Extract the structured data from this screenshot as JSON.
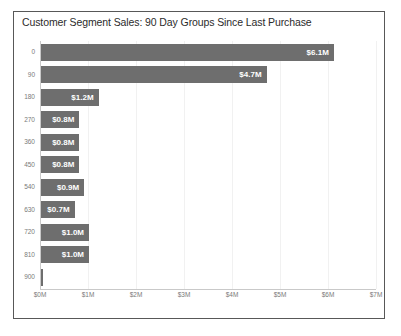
{
  "chart_data": {
    "type": "bar",
    "orientation": "horizontal",
    "title": "Customer Segment Sales: 90 Day Groups Since Last Purchase",
    "xlabel": "",
    "ylabel": "",
    "categories": [
      "0",
      "90",
      "180",
      "270",
      "360",
      "450",
      "540",
      "630",
      "720",
      "810",
      "900"
    ],
    "values": [
      6.1,
      4.7,
      1.2,
      0.8,
      0.8,
      0.8,
      0.9,
      0.7,
      1.0,
      1.0,
      0.03
    ],
    "data_labels": [
      "$6.1M",
      "$4.7M",
      "$1.2M",
      "$0.8M",
      "$0.8M",
      "$0.8M",
      "$0.9M",
      "$0.7M",
      "$1.0M",
      "$1.0M",
      ""
    ],
    "xlim": [
      0,
      7
    ],
    "x_tick_values": [
      0,
      1,
      2,
      3,
      4,
      5,
      6,
      7
    ],
    "x_tick_labels": [
      "$0M",
      "$1M",
      "$2M",
      "$3M",
      "$4M",
      "$5M",
      "$6M",
      "$7M"
    ],
    "grid": "vertical-light",
    "legend": "none",
    "bar_color": "#6e6e6e",
    "data_label_color": "#ffffff",
    "tick_label_color": "#7a7a7a",
    "border_color": "#585858",
    "background_color": "#ffffff"
  }
}
